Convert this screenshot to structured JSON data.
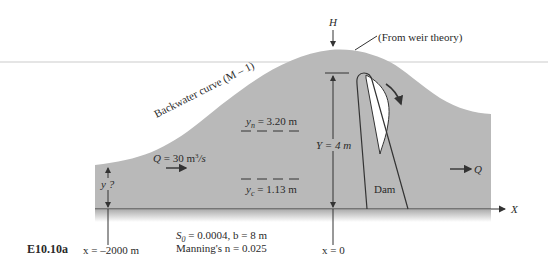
{
  "figure": {
    "id_label": "E10.10a",
    "colors": {
      "water": "#b9b9b9",
      "line": "#333333",
      "background": "#ffffff",
      "guide_line": "#d8d8d8"
    }
  },
  "labels": {
    "head": "H",
    "weir_note": "(From weir theory)",
    "backwater": "Backwater curve (M – 1)",
    "yn_symbol": "y",
    "yn_sub": "n",
    "yn_value": " = 3.20 m",
    "yc_symbol": "y",
    "yc_sub": "c",
    "yc_value": " = 1.13 m",
    "dam_height": "Y = 4 m",
    "upstream_depth": "y ?",
    "flow_in_q": "Q",
    "flow_in_value": " = 30 m",
    "flow_in_sup": "3",
    "flow_in_unit": "/s",
    "flow_out_q": "Q",
    "dam": "Dam",
    "axis_x": "X",
    "x_upstream": "x = –2000 m",
    "x_dam": "x = 0",
    "slope_s": "S",
    "slope_sub": "0",
    "slope_text": " = 0.0004, b = 8 m",
    "manning": "Manning's n = 0.025"
  }
}
